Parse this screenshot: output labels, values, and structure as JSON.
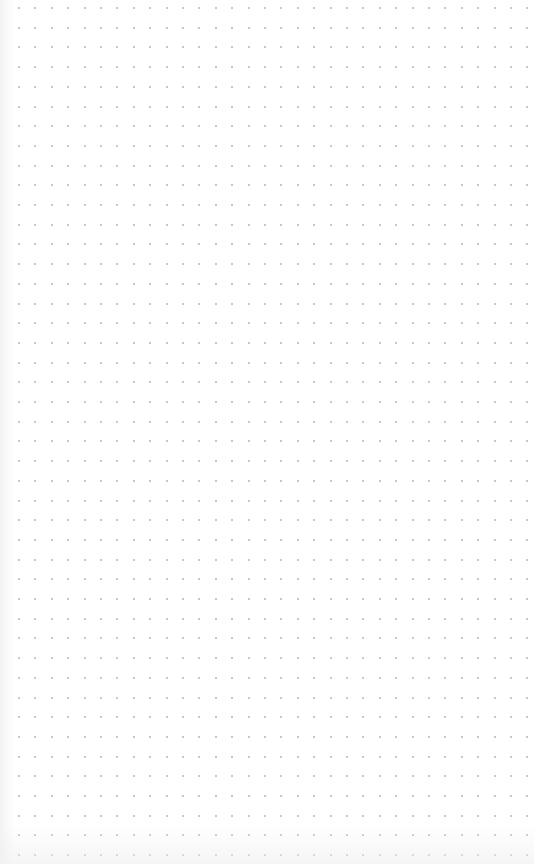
{
  "canvas": {
    "background_color": "#ffffff",
    "width": 534,
    "height": 864
  },
  "dot_grid": {
    "dot_color": "#b4b4b4",
    "dot_size": 2,
    "origin_x": 19,
    "origin_y": 8,
    "spacing_x": 16.4,
    "spacing_y": 19.7,
    "columns": 32,
    "rows": 44
  }
}
